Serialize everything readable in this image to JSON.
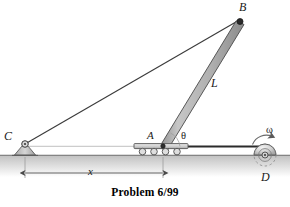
{
  "figure": {
    "caption": "Problem 6/99",
    "background_color": "#ffffff",
    "line_color": "#3b3b3b",
    "bar_fill_color": "#b8b8b8",
    "ground_color": "#c9c9c9",
    "wheel_color": "#cfcfcf"
  },
  "labels": {
    "point_b": "B",
    "point_c": "C",
    "point_a": "A",
    "point_d": "D",
    "bar_length": "L",
    "angle_theta": "θ",
    "angular_velocity": "ω",
    "distance_x": "x"
  },
  "geometry": {
    "point_a": {
      "x": 163,
      "y": 146
    },
    "point_b": {
      "x": 240,
      "y": 19
    },
    "point_c": {
      "x": 25,
      "y": 144
    },
    "point_d": {
      "x": 265,
      "y": 155
    },
    "ground_y": 155,
    "bar_half_width": 4.5,
    "wheel_radius": 11,
    "dimension_line_y": 173
  },
  "elements": {
    "ground_label": "ground-line",
    "bar_label": "rigid-bar-ab",
    "cable_label": "cable-cb",
    "cart_label": "roller-cart-a",
    "drum_label": "rotating-drum-d",
    "support_label": "pin-support-c"
  }
}
